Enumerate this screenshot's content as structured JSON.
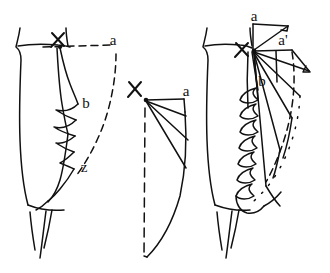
{
  "diagram": {
    "type": "line-art-technical-illustration",
    "background_color": "#ffffff",
    "ink_color": "#111111",
    "width": 330,
    "height": 273,
    "panels": [
      {
        "id": "left",
        "name": "draped-garment-front-view",
        "description": "Skirt on body with cascade drape falling at side; dashed construction line from waist point X out to a, and dashed curve down to z",
        "labels": [
          {
            "key": "x",
            "text": "X",
            "x": 57,
            "y": 42
          },
          {
            "key": "a",
            "text": "a",
            "x": 117,
            "y": 42
          },
          {
            "key": "b",
            "text": "b",
            "x": 86,
            "y": 103
          },
          {
            "key": "z",
            "text": "z",
            "x": 84,
            "y": 168
          }
        ]
      },
      {
        "id": "middle",
        "name": "flat-pattern-quarter-circle",
        "description": "Flat pattern piece: point X at top-left with radiating slash lines fanning to a curved hem; top edge runs to a; left edge dashed vertical",
        "labels": [
          {
            "key": "x",
            "text": "X",
            "x": 134,
            "y": 90
          },
          {
            "key": "a",
            "text": "a",
            "x": 184,
            "y": 92
          }
        ]
      },
      {
        "id": "right",
        "name": "spread-pattern-on-body",
        "description": "Garment with ruffled cascade plus the spread pattern overlaid; rays from X fan out to a and a-prime with dotted arc marking the swept hem",
        "labels": [
          {
            "key": "a",
            "text": "a",
            "x": 254,
            "y": 19
          },
          {
            "key": "x",
            "text": "X",
            "x": 241,
            "y": 58
          },
          {
            "key": "aprime",
            "text": "a'",
            "x": 283,
            "y": 47
          },
          {
            "key": "b",
            "text": "b",
            "x": 261,
            "y": 81
          }
        ]
      }
    ],
    "line_styles": {
      "solid": "solid garment and pattern outlines",
      "dashed": "construction / reference lines",
      "dotted": "swept hem arc"
    }
  }
}
